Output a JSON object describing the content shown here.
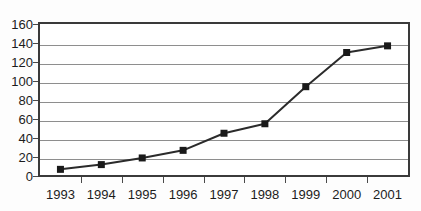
{
  "title_remnant": "",
  "chart_data": {
    "type": "line",
    "title": "",
    "xlabel": "",
    "ylabel": "",
    "categories": [
      "1993",
      "1994",
      "1995",
      "1996",
      "1997",
      "1998",
      "1999",
      "2000",
      "2001"
    ],
    "values": [
      7,
      12,
      19,
      27,
      45,
      55,
      94,
      130,
      137
    ],
    "series": [
      {
        "name": "",
        "values": [
          7,
          12,
          19,
          27,
          45,
          55,
          94,
          130,
          137
        ]
      }
    ],
    "ylim": [
      0,
      160
    ],
    "ytick_step": 20,
    "yticks": [
      0,
      20,
      40,
      60,
      80,
      100,
      120,
      140,
      160
    ],
    "grid": true,
    "legend": false,
    "legend_position": "none",
    "marker": "square",
    "line_color": "#2b2b2b",
    "marker_color": "#1a1a1a",
    "grid_color": "#8e8e8e",
    "frame_color": "#3a3a3a",
    "background_color": "#ffffff"
  }
}
